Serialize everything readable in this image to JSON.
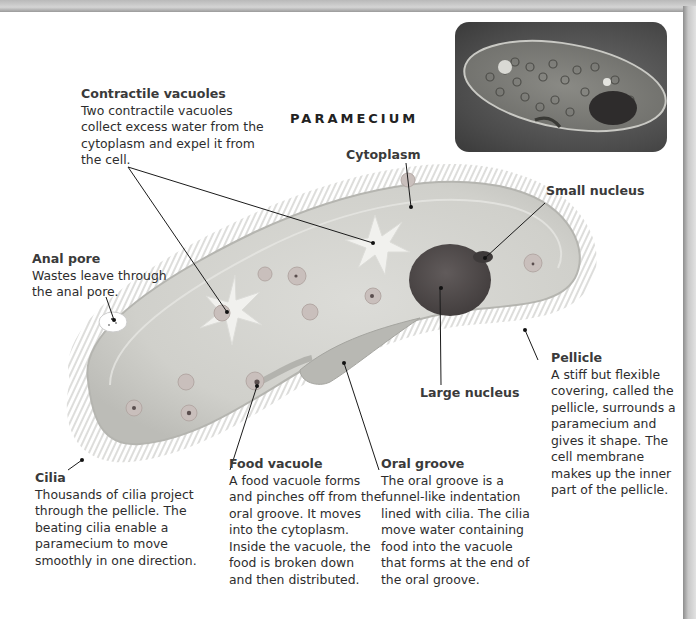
{
  "diagram": {
    "title": "PARAMECIUM",
    "labels": {
      "contractile_vacuoles": {
        "title": "Contractile vacuoles",
        "desc": "Two contractile vacuoles\ncollect excess water from the\ncytoplasm and expel it from\nthe cell."
      },
      "cytoplasm": {
        "title": "Cytoplasm"
      },
      "small_nucleus": {
        "title": "Small nucleus"
      },
      "anal_pore": {
        "title": "Anal pore",
        "desc": "Wastes leave through\nthe anal pore."
      },
      "large_nucleus": {
        "title": "Large nucleus"
      },
      "pellicle": {
        "title": "Pellicle",
        "desc": "A stiff but flexible\ncovering, called the\npellicle, surrounds a\nparamecium and\ngives it shape. The\ncell membrane\nmakes up the inner\npart of the pellicle."
      },
      "cilia": {
        "title": "Cilia",
        "desc": "Thousands of cilia project\nthrough the pellicle. The\nbeating cilia enable a\nparamecium to move\nsmoothly in one direction."
      },
      "food_vacuole": {
        "title": "Food vacuole",
        "desc": "A food vacuole forms\nand pinches off from the\noral groove. It moves\ninto the cytoplasm.\nInside the vacuole, the\nfood is broken down\nand then distributed."
      },
      "oral_groove": {
        "title": "Oral groove",
        "desc": "The oral groove is a\nfunnel-like indentation\nlined with cilia. The cilia\nmove water containing\nfood into the vacuole\nthat forms at the end of\nthe oral groove."
      }
    },
    "photo": {
      "alt": "micrograph-of-paramecium"
    },
    "colors": {
      "cell_fill": "#d6d6d2",
      "cell_edge": "#b9b9b5",
      "large_nucleus": "#4f4a4a",
      "small_nucleus": "#3e3a3a",
      "leader_line": "#1a1a1a"
    }
  }
}
